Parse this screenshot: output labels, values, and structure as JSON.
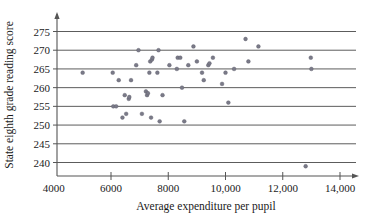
{
  "chart_data": {
    "type": "scatter",
    "title": "",
    "xlabel": "Average expenditure per pupil",
    "ylabel": "State eighth grade reading score",
    "xlim": [
      3400,
      14900
    ],
    "ylim": [
      236,
      277
    ],
    "grid": true,
    "legend": null,
    "xticks": [
      4000,
      6000,
      8000,
      10000,
      12000,
      14000
    ],
    "xticklabels": [
      "4000",
      "6000",
      "8000",
      "10,000",
      "12,000",
      "14,000"
    ],
    "yticks": [
      240,
      245,
      250,
      255,
      260,
      265,
      270,
      275
    ],
    "yticklabels": [
      "240",
      "245",
      "250",
      "255",
      "260",
      "265",
      "270",
      "275"
    ],
    "marker_color": "#7a7a88",
    "points": [
      {
        "x": 5010,
        "y": 264
      },
      {
        "x": 6060,
        "y": 264
      },
      {
        "x": 6080,
        "y": 255
      },
      {
        "x": 6180,
        "y": 255
      },
      {
        "x": 6270,
        "y": 262
      },
      {
        "x": 6400,
        "y": 252
      },
      {
        "x": 6480,
        "y": 258
      },
      {
        "x": 6530,
        "y": 253
      },
      {
        "x": 6620,
        "y": 257
      },
      {
        "x": 6640,
        "y": 257.5
      },
      {
        "x": 6700,
        "y": 262
      },
      {
        "x": 6880,
        "y": 266
      },
      {
        "x": 6960,
        "y": 270
      },
      {
        "x": 7080,
        "y": 253
      },
      {
        "x": 7220,
        "y": 259
      },
      {
        "x": 7260,
        "y": 258
      },
      {
        "x": 7290,
        "y": 258.5
      },
      {
        "x": 7340,
        "y": 264
      },
      {
        "x": 7370,
        "y": 267
      },
      {
        "x": 7400,
        "y": 252
      },
      {
        "x": 7430,
        "y": 267.5
      },
      {
        "x": 7450,
        "y": 268
      },
      {
        "x": 7620,
        "y": 264
      },
      {
        "x": 7660,
        "y": 270
      },
      {
        "x": 7700,
        "y": 251
      },
      {
        "x": 7800,
        "y": 258
      },
      {
        "x": 8040,
        "y": 266
      },
      {
        "x": 8300,
        "y": 265
      },
      {
        "x": 8330,
        "y": 268
      },
      {
        "x": 8420,
        "y": 268
      },
      {
        "x": 8480,
        "y": 260
      },
      {
        "x": 8560,
        "y": 251
      },
      {
        "x": 8700,
        "y": 266
      },
      {
        "x": 8880,
        "y": 271
      },
      {
        "x": 9000,
        "y": 267
      },
      {
        "x": 9180,
        "y": 264
      },
      {
        "x": 9240,
        "y": 262
      },
      {
        "x": 9400,
        "y": 266
      },
      {
        "x": 9440,
        "y": 266.5
      },
      {
        "x": 9560,
        "y": 268
      },
      {
        "x": 9880,
        "y": 261
      },
      {
        "x": 10000,
        "y": 264
      },
      {
        "x": 10100,
        "y": 256
      },
      {
        "x": 10300,
        "y": 265
      },
      {
        "x": 10700,
        "y": 273
      },
      {
        "x": 10800,
        "y": 267
      },
      {
        "x": 11150,
        "y": 271
      },
      {
        "x": 12800,
        "y": 239
      },
      {
        "x": 12980,
        "y": 268
      },
      {
        "x": 13000,
        "y": 265
      }
    ]
  }
}
